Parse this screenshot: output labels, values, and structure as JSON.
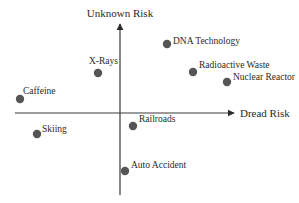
{
  "diagram": {
    "type": "quadrant-scatter",
    "axes": {
      "x_label": "Dread Risk",
      "y_label": "Unknown Risk"
    },
    "colors": {
      "axis": "#3a3a3a",
      "point": "#555555",
      "text": "#2a2a2a"
    },
    "points": [
      {
        "label": "DNA Technology",
        "x": 167,
        "y": 44,
        "lx": 173,
        "ly": 44
      },
      {
        "label": "X-Rays",
        "x": 98,
        "y": 73,
        "lx": 89,
        "ly": 64
      },
      {
        "label": "Radioactive Waste",
        "x": 193,
        "y": 72,
        "lx": 199,
        "ly": 68
      },
      {
        "label": "Nuclear Reactor",
        "x": 227,
        "y": 82,
        "lx": 233,
        "ly": 80
      },
      {
        "label": "Caffeine",
        "x": 20,
        "y": 99,
        "lx": 23,
        "ly": 94
      },
      {
        "label": "Skiing",
        "x": 37,
        "y": 134,
        "lx": 42,
        "ly": 132
      },
      {
        "label": "Railroads",
        "x": 133,
        "y": 126,
        "lx": 139,
        "ly": 122
      },
      {
        "label": "Auto Accident",
        "x": 125,
        "y": 171,
        "lx": 131,
        "ly": 168
      }
    ]
  }
}
